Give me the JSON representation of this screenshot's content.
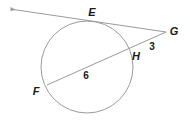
{
  "figure": {
    "type": "circle-tangent-secant-diagram",
    "width": 190,
    "height": 124,
    "background_color": "#ffffff",
    "stroke_color": "#9a9a9a",
    "text_color": "#1a1a1a"
  },
  "circle": {
    "name": "circle",
    "center_x": 87,
    "center_y": 67,
    "radius": 46,
    "stroke_color": "#9a9a9a",
    "stroke_width": 1
  },
  "points": [
    {
      "id": "E",
      "label": "E",
      "x": 93,
      "y": 22,
      "label_x": 92,
      "label_y": 12,
      "role": "tangent-point"
    },
    {
      "id": "G",
      "label": "G",
      "x": 166,
      "y": 32,
      "label_x": 174,
      "label_y": 31,
      "role": "external-vertex"
    },
    {
      "id": "H",
      "label": "H",
      "x": 131,
      "y": 48,
      "label_x": 136,
      "label_y": 56,
      "role": "near-secant-intersection"
    },
    {
      "id": "F",
      "label": "F",
      "x": 47,
      "y": 85,
      "label_x": 36,
      "label_y": 91,
      "role": "far-secant-intersection"
    }
  ],
  "segments": [
    {
      "id": "tangent-line",
      "name": "tangent-line-EG",
      "from_x": 10,
      "from_y": 9,
      "to_x": 166,
      "to_y": 32,
      "has_arrow_start": true,
      "has_arrow_end": false
    },
    {
      "id": "secant-line",
      "name": "secant-line-FHG",
      "from_x": 47,
      "from_y": 85,
      "to_x": 166,
      "to_y": 32,
      "has_arrow_start": false,
      "has_arrow_end": false
    }
  ],
  "measures": [
    {
      "id": "HG",
      "value": "3",
      "x": 152,
      "y": 47,
      "describes": "segment-HG-length"
    },
    {
      "id": "FH",
      "value": "6",
      "x": 86,
      "y": 76,
      "describes": "segment-FH-length"
    }
  ]
}
